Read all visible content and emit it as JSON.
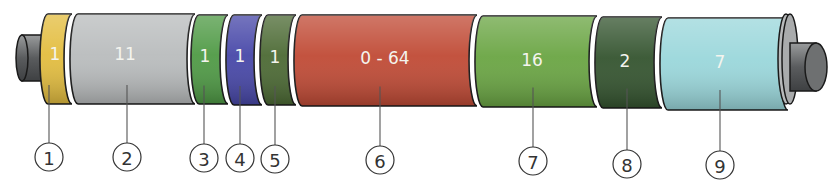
{
  "segments": [
    {
      "id": 1,
      "label": "1",
      "color": "#e3bd3f",
      "callout": "1"
    },
    {
      "id": 2,
      "label": "11",
      "color": "#b9bcbd",
      "callout": "2"
    },
    {
      "id": 3,
      "label": "1",
      "color": "#4f9a45",
      "callout": "3"
    },
    {
      "id": 4,
      "label": "1",
      "color": "#4747a8",
      "callout": "4"
    },
    {
      "id": 5,
      "label": "1",
      "color": "#4c6a34",
      "callout": "5"
    },
    {
      "id": 6,
      "label": "0 - 64",
      "color": "#c04a35",
      "callout": "6"
    },
    {
      "id": 7,
      "label": "16",
      "color": "#6aa543",
      "callout": "7"
    },
    {
      "id": 8,
      "label": "2",
      "color": "#34542f",
      "callout": "8"
    },
    {
      "id": 9,
      "label": "7",
      "color": "#9ad7db",
      "callout": "9"
    }
  ],
  "stub_color": "#707273"
}
